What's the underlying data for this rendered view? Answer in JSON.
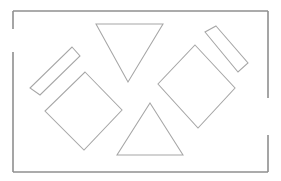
{
  "canvas": {
    "width": 281,
    "height": 181,
    "background_color": "#ffffff",
    "title": "Geometric shapes line drawing"
  },
  "frame": {
    "name": "outer-border-frame",
    "stroke_color": "#8f8f8f",
    "stroke_width": 1.6,
    "left": 13,
    "top": 11,
    "right": 268,
    "bottom": 172,
    "segments": [
      {
        "name": "frame-top-edge",
        "points": "13,11 268,11"
      },
      {
        "name": "frame-right-edge-upper",
        "points": "268,11 268,98"
      },
      {
        "name": "frame-right-edge-lower",
        "points": "268,135 268,172"
      },
      {
        "name": "frame-bottom-edge",
        "points": "268,172 13,172"
      },
      {
        "name": "frame-left-edge-lower",
        "points": "13,172 13,52"
      },
      {
        "name": "frame-left-edge-upper",
        "points": "13,29 13,11"
      }
    ],
    "gaps": [
      {
        "name": "left-edge-gap",
        "edge": "left",
        "from_y": 29,
        "to_y": 52
      },
      {
        "name": "right-edge-gap",
        "edge": "right",
        "from_y": 98,
        "to_y": 135
      }
    ]
  },
  "shapes": [
    {
      "name": "triangle-pointing-down",
      "type": "triangle",
      "orientation": "down",
      "points": "96,24 163,24 128,82",
      "stroke_color": "#a6a6a6",
      "fill_color": "#ffffff"
    },
    {
      "name": "triangle-pointing-up",
      "type": "triangle",
      "orientation": "up",
      "points": "150,103 183,155 117,155",
      "stroke_color": "#a6a6a6",
      "fill_color": "#ffffff"
    },
    {
      "name": "diamond-left",
      "type": "rotated-square",
      "rotation_degrees": 45,
      "points": "85,72 122,110 84,150 45,111",
      "stroke_color": "#a6a6a6",
      "fill_color": "#ffffff"
    },
    {
      "name": "diamond-right",
      "type": "rotated-square",
      "rotation_degrees": 45,
      "points": "195,45 235,88 198,128 158,84",
      "stroke_color": "#a6a6a6",
      "fill_color": "#ffffff"
    },
    {
      "name": "bar-upper-left-diagonal",
      "type": "rotated-rectangle",
      "rotation_degrees": 135,
      "points": "72,47 80,56 40,95 30,88",
      "stroke_color": "#a6a6a6",
      "fill_color": "#ffffff"
    },
    {
      "name": "bar-upper-right-diagonal",
      "type": "rotated-rectangle",
      "rotation_degrees": 45,
      "points": "216,26 248,63 238,72 205,32",
      "stroke_color": "#a6a6a6",
      "fill_color": "#ffffff"
    }
  ]
}
